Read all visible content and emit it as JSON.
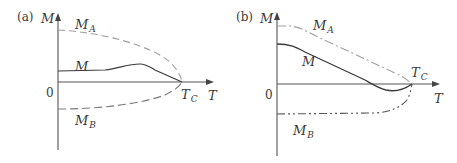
{
  "figure": {
    "panels": [
      {
        "id": "a",
        "tag": "(a)",
        "y_axis_label": "M",
        "x_axis_label": "T",
        "origin_label": "0",
        "critical_label": {
          "main": "T",
          "sub": "C"
        },
        "curves": [
          {
            "name": "M_A",
            "label_main": "M",
            "label_sub": "A",
            "style": "dashed"
          },
          {
            "name": "M",
            "label_main": "M",
            "label_sub": "",
            "style": "solid"
          },
          {
            "name": "M_B",
            "label_main": "M",
            "label_sub": "B",
            "style": "dashed"
          }
        ]
      },
      {
        "id": "b",
        "tag": "(b)",
        "y_axis_label": "M",
        "x_axis_label": "T",
        "origin_label": "0",
        "critical_label": {
          "main": "T",
          "sub": "C"
        },
        "curves": [
          {
            "name": "M_A",
            "label_main": "M",
            "label_sub": "A",
            "style": "dash-dot"
          },
          {
            "name": "M",
            "label_main": "M",
            "label_sub": "",
            "style": "solid"
          },
          {
            "name": "M_B",
            "label_main": "M",
            "label_sub": "B",
            "style": "dash-dot-dot"
          }
        ]
      }
    ],
    "colors": {
      "axis": "#555555",
      "solid_curve": "#3a3a3a",
      "dashed_curve": "#9a9a9a",
      "text": "#3a3a3a"
    }
  }
}
